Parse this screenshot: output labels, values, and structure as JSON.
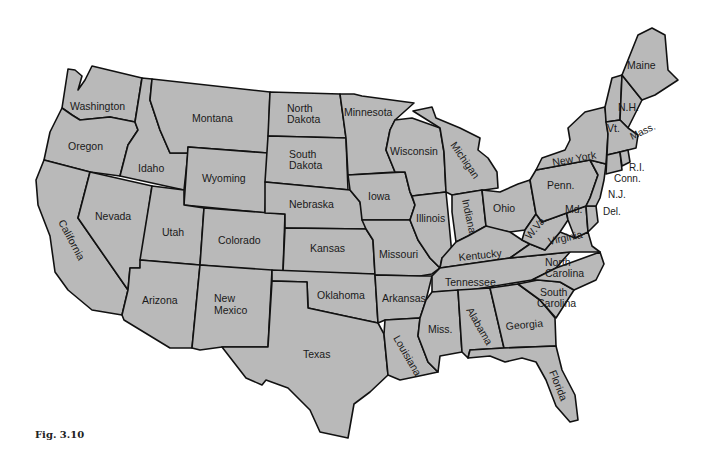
{
  "figure": {
    "caption": "Fig. 3.10",
    "fill_color": "#b9b9b9",
    "border_color": "#111111",
    "background": "#ffffff"
  },
  "labels": {
    "washington": "Washington",
    "oregon": "Oregon",
    "california": "California",
    "idaho": "Idaho",
    "nevada": "Nevada",
    "montana": "Montana",
    "wyoming": "Wyoming",
    "utah": "Utah",
    "arizona": "Arizona",
    "colorado": "Colorado",
    "new_mexico_1": "New",
    "new_mexico_2": "Mexico",
    "north_dakota_1": "North",
    "north_dakota_2": "Dakota",
    "south_dakota_1": "South",
    "south_dakota_2": "Dakota",
    "nebraska": "Nebraska",
    "kansas": "Kansas",
    "oklahoma": "Oklahoma",
    "texas": "Texas",
    "minnesota": "Minnesota",
    "iowa": "Iowa",
    "missouri": "Missouri",
    "arkansas": "Arkansas",
    "louisiana": "Louisiana",
    "wisconsin": "Wisconsin",
    "illinois": "Illinois",
    "michigan": "Michigan",
    "indiana": "Indiana",
    "ohio": "Ohio",
    "kentucky": "Kentucky",
    "tennessee": "Tennessee",
    "mississippi": "Miss.",
    "alabama": "Alabama",
    "georgia": "Georgia",
    "florida": "Florida",
    "south_carolina_1": "South",
    "south_carolina_2": "Carolina",
    "north_carolina_1": "North",
    "north_carolina_2": "Carolina",
    "virginia": "Virginia",
    "west_virginia": "W.Va.",
    "maryland": "Md.",
    "delaware": "Del.",
    "new_jersey": "N.J.",
    "pennsylvania": "Penn.",
    "new_york": "New York",
    "connecticut": "Conn.",
    "rhode_island": "R.I.",
    "massachusetts": "Mass.",
    "vermont": "Vt.",
    "new_hampshire": "N.H.",
    "maine": "Maine"
  }
}
